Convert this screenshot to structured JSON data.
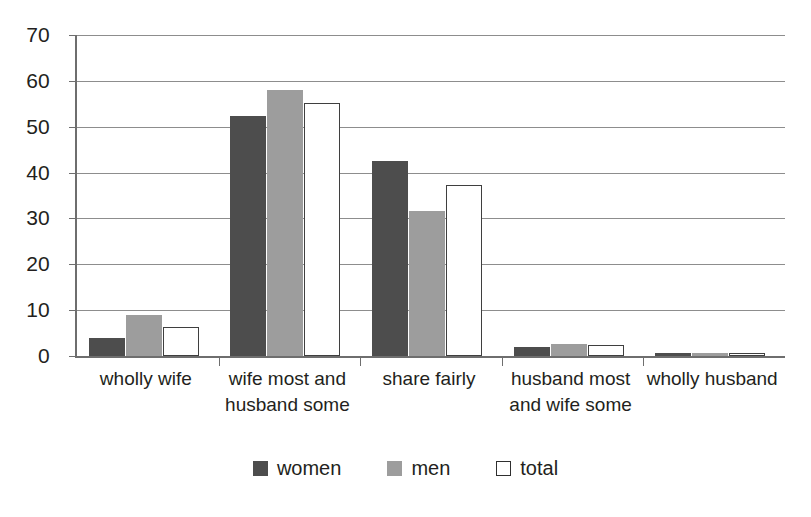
{
  "chart_data": {
    "type": "bar",
    "title": "",
    "subtitle": "",
    "xlabel": "",
    "ylabel": "",
    "ylim": [
      0,
      70
    ],
    "ytick_step": 10,
    "yticks": [
      70,
      60,
      50,
      40,
      30,
      20,
      10,
      0
    ],
    "grid": true,
    "legend_position": "bottom",
    "categories": [
      "wholly wife",
      "wife most and husband some",
      "share fairly",
      "husband most and wife some",
      "wholly husband"
    ],
    "category_lines": [
      [
        "wholly wife"
      ],
      [
        "wife most and",
        "husband some"
      ],
      [
        "share fairly"
      ],
      [
        "husband most",
        "and wife some"
      ],
      [
        "wholly husband"
      ]
    ],
    "series": [
      {
        "name": "women",
        "color": "#4d4d4d",
        "values": [
          4,
          52.4,
          42.6,
          2,
          0.6
        ]
      },
      {
        "name": "men",
        "color": "#9d9d9d",
        "values": [
          9,
          58,
          31.7,
          2.6,
          0.6
        ]
      },
      {
        "name": "total",
        "color": "#ffffff",
        "values": [
          6.4,
          55.2,
          37.3,
          2.3,
          0.6
        ]
      }
    ]
  },
  "legend": {
    "items": [
      {
        "label": "women",
        "swatch": "filled-dark-square-icon"
      },
      {
        "label": "men",
        "swatch": "filled-gray-square-icon"
      },
      {
        "label": "total",
        "swatch": "outlined-white-square-icon"
      }
    ]
  },
  "colors": {
    "women": "#4d4d4d",
    "men": "#9d9d9d",
    "total_fill": "#ffffff",
    "total_border": "#3f3f3f",
    "axis": "#6e6e6e",
    "gridline": "#8d8d8d",
    "text": "#231f20",
    "background": "#ffffff"
  }
}
